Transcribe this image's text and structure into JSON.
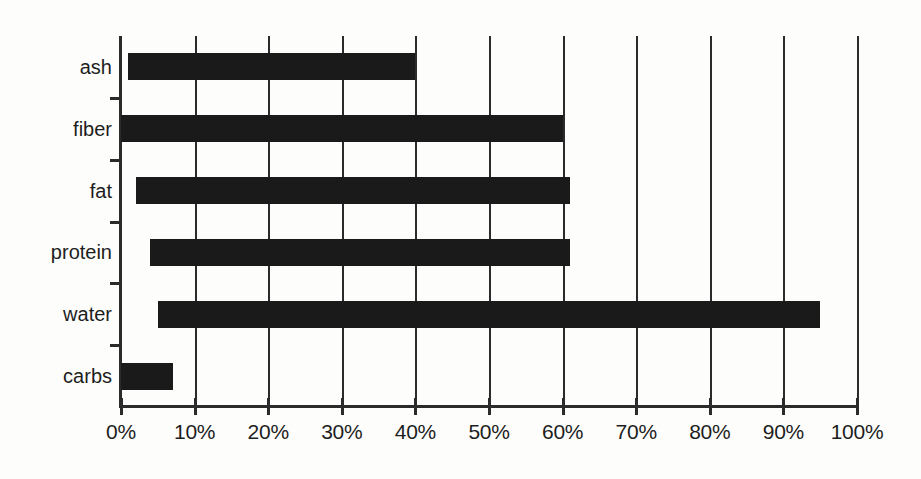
{
  "chart_data": {
    "type": "bar",
    "orientation": "horizontal",
    "bar_style": "range",
    "title": "",
    "subtitle": "",
    "xlabel": "",
    "ylabel": "",
    "categories": [
      "ash",
      "fiber",
      "fat",
      "protein",
      "water",
      "carbs"
    ],
    "series": [
      {
        "name": "composition range",
        "ranges": [
          {
            "category": "ash",
            "start": 1,
            "end": 40
          },
          {
            "category": "fiber",
            "start": 0,
            "end": 60
          },
          {
            "category": "fat",
            "start": 2,
            "end": 61
          },
          {
            "category": "protein",
            "start": 4,
            "end": 61
          },
          {
            "category": "water",
            "start": 5,
            "end": 95
          },
          {
            "category": "carbs",
            "start": 0,
            "end": 7
          }
        ],
        "values": [
          39,
          60,
          59,
          57,
          90,
          7
        ]
      }
    ],
    "xlim": [
      0,
      100
    ],
    "xtick_values": [
      0,
      10,
      20,
      30,
      40,
      50,
      60,
      70,
      80,
      90,
      100
    ],
    "xtick_labels": [
      "0%",
      "10%",
      "20%",
      "30%",
      "40%",
      "50%",
      "60%",
      "70%",
      "80%",
      "90%",
      "100%"
    ],
    "grid": {
      "vertical": true,
      "horizontal": false
    },
    "legend": {
      "visible": false,
      "position": "none"
    },
    "colors": {
      "bar": "#1a1a1a",
      "axis": "#2b2b2b",
      "gridline": "#2b2b2b",
      "text": "#1d1d1d",
      "background": "#fdfdfc"
    }
  }
}
